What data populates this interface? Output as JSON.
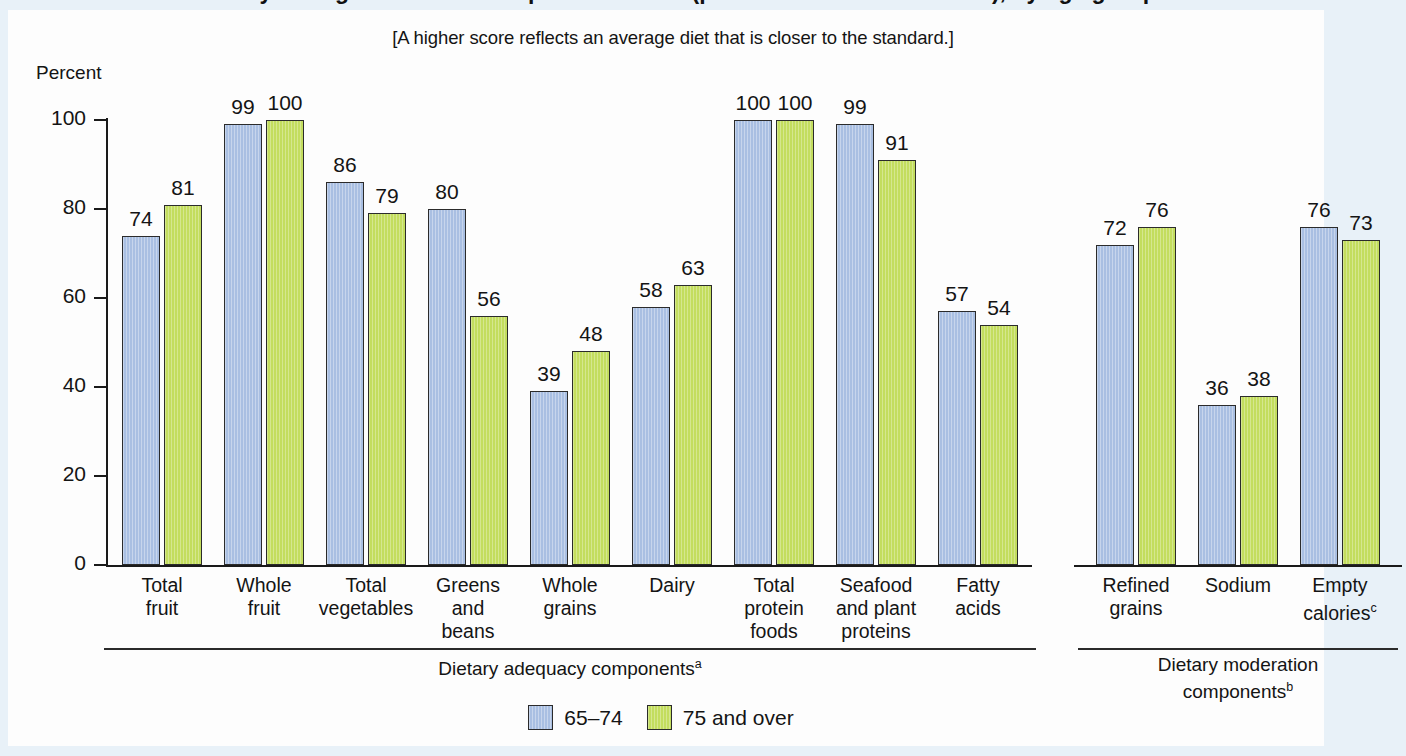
{
  "figure": {
    "title": "Healthy Eating Index-2010 component scores (percent of maximum score), by age group",
    "subtitle": "[A higher score reflects an average diet that is closer to the standard.]",
    "y_axis_label": "Percent"
  },
  "axis": {
    "ticks": [
      "100",
      "80",
      "60",
      "40",
      "20",
      "0"
    ]
  },
  "legend": [
    {
      "label": "65–74",
      "color": "#a9bfe2"
    },
    {
      "label": "75 and over",
      "color": "#c3dd5e"
    }
  ],
  "groups": [
    {
      "caption_line1": "Dietary adequacy",
      "caption_line2": "components",
      "note": "a"
    },
    {
      "caption_line1": "Dietary moderation",
      "caption_line2": "components",
      "note": "b"
    }
  ],
  "chart_data": {
    "type": "bar",
    "title": "Healthy Eating Index-2010 component scores (percent of maximum score), by age group",
    "subtitle": "[A higher score reflects an average diet that is closer to the standard.]",
    "xlabel": "",
    "ylabel": "Percent",
    "ylim": [
      0,
      100
    ],
    "yticks": [
      0,
      20,
      40,
      60,
      80,
      100
    ],
    "grid": false,
    "legend_position": "bottom-center",
    "categories": [
      "Total fruit",
      "Whole fruit",
      "Total vegetables",
      "Greens and beans",
      "Whole grains",
      "Dairy",
      "Total protein foods",
      "Seafood and plant proteins",
      "Fatty acids",
      "Refined grains",
      "Sodium",
      "Empty calories"
    ],
    "category_labels": [
      [
        "Total",
        "fruit"
      ],
      [
        "Whole",
        "fruit"
      ],
      [
        "Total",
        "vegetables"
      ],
      [
        "Greens",
        "and",
        "beans"
      ],
      [
        "Whole",
        "grains"
      ],
      [
        "Dairy"
      ],
      [
        "Total",
        "protein",
        "foods"
      ],
      [
        "Seafood",
        "and plant",
        "proteins"
      ],
      [
        "Fatty",
        "acids"
      ],
      [
        "Refined",
        "grains"
      ],
      [
        "Sodium"
      ],
      [
        "Empty",
        "calories"
      ]
    ],
    "category_notes": [
      "",
      "",
      "",
      "",
      "",
      "",
      "",
      "",
      "",
      "",
      "",
      "c"
    ],
    "series": [
      {
        "name": "65–74",
        "color": "#a9bfe2",
        "values": [
          74,
          99,
          86,
          80,
          39,
          58,
          100,
          99,
          57,
          72,
          36,
          76
        ]
      },
      {
        "name": "75 and over",
        "color": "#c3dd5e",
        "values": [
          81,
          100,
          79,
          56,
          48,
          63,
          100,
          91,
          54,
          76,
          38,
          73
        ]
      }
    ],
    "group_sections": [
      {
        "label": "Dietary adequacy components",
        "note": "a",
        "categories": 0,
        "span": [
          0,
          8
        ]
      },
      {
        "label": "Dietary moderation components",
        "note": "b",
        "span": [
          9,
          11
        ]
      }
    ]
  }
}
